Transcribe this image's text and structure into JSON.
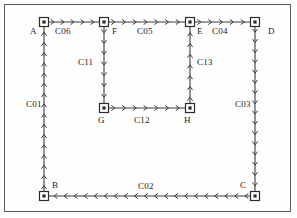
{
  "diagram": {
    "type": "directed-network-graph",
    "title": "",
    "stroke_color": "#3c3c3c",
    "node_fill": "#ffffff",
    "node_stroke": "#2b2b2b",
    "frame_color": "#5a5a5a",
    "nodes": [
      {
        "id": "A",
        "label": "A",
        "x": 44,
        "y": 22,
        "label_x": 30,
        "label_y": 27
      },
      {
        "id": "B",
        "label": "B",
        "x": 44,
        "y": 196,
        "label_x": 52,
        "label_y": 181
      },
      {
        "id": "C",
        "label": "C",
        "x": 255,
        "y": 196,
        "label_x": 240,
        "label_y": 181
      },
      {
        "id": "D",
        "label": "D",
        "x": 255,
        "y": 22,
        "label_x": 268,
        "label_y": 27
      },
      {
        "id": "E",
        "label": "E",
        "x": 190,
        "y": 22,
        "label_x": 197,
        "label_y": 27
      },
      {
        "id": "F",
        "label": "F",
        "x": 104,
        "y": 22,
        "label_x": 112,
        "label_y": 27
      },
      {
        "id": "G",
        "label": "G",
        "x": 104,
        "y": 108,
        "label_x": 98,
        "label_y": 116
      },
      {
        "id": "H",
        "label": "H",
        "x": 190,
        "y": 108,
        "label_x": 184,
        "label_y": 116
      }
    ],
    "links": [
      {
        "id": "C01",
        "label": "C01",
        "from": "B",
        "to": "A",
        "orientation": "vertical",
        "x1": 44,
        "y1": 196,
        "x2": 44,
        "y2": 22,
        "direction": "up",
        "label_x": 26,
        "label_y": 100
      },
      {
        "id": "C02",
        "label": "C02",
        "from": "C",
        "to": "B",
        "orientation": "horizontal",
        "x1": 255,
        "y1": 196,
        "x2": 44,
        "y2": 196,
        "direction": "left",
        "label_x": 138,
        "label_y": 182
      },
      {
        "id": "C03",
        "label": "C03",
        "from": "D",
        "to": "C",
        "orientation": "vertical",
        "x1": 255,
        "y1": 22,
        "x2": 255,
        "y2": 196,
        "direction": "down",
        "label_x": 235,
        "label_y": 100
      },
      {
        "id": "C04",
        "label": "C04",
        "from": "E",
        "to": "D",
        "orientation": "horizontal",
        "x1": 190,
        "y1": 22,
        "x2": 255,
        "y2": 22,
        "direction": "right",
        "label_x": 212,
        "label_y": 27
      },
      {
        "id": "C05",
        "label": "C05",
        "from": "F",
        "to": "E",
        "orientation": "horizontal",
        "x1": 104,
        "y1": 22,
        "x2": 190,
        "y2": 22,
        "direction": "right",
        "label_x": 137,
        "label_y": 27
      },
      {
        "id": "C06",
        "label": "C06",
        "from": "A",
        "to": "F",
        "orientation": "horizontal",
        "x1": 44,
        "y1": 22,
        "x2": 104,
        "y2": 22,
        "direction": "right",
        "label_x": 55,
        "label_y": 27
      },
      {
        "id": "C11",
        "label": "C11",
        "from": "F",
        "to": "G",
        "orientation": "vertical",
        "x1": 104,
        "y1": 22,
        "x2": 104,
        "y2": 108,
        "direction": "down",
        "label_x": 78,
        "label_y": 58
      },
      {
        "id": "C12",
        "label": "C12",
        "from": "G",
        "to": "H",
        "orientation": "horizontal",
        "x1": 104,
        "y1": 108,
        "x2": 190,
        "y2": 108,
        "direction": "right",
        "label_x": 134,
        "label_y": 116
      },
      {
        "id": "C13",
        "label": "C13",
        "from": "H",
        "to": "E",
        "orientation": "vertical",
        "x1": 190,
        "y1": 108,
        "x2": 190,
        "y2": 22,
        "direction": "up",
        "label_x": 197,
        "label_y": 58
      }
    ]
  }
}
